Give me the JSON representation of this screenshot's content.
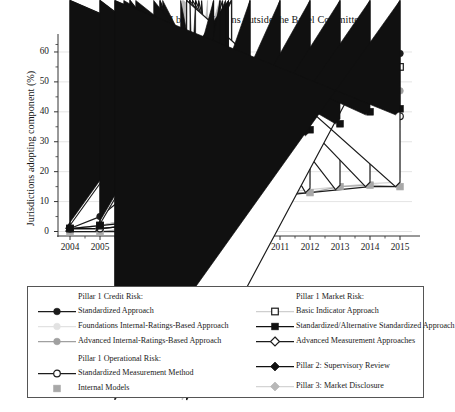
{
  "chart_data": {
    "type": "line",
    "title": "Adoption of Basel II by jurisdictions outside the Basel Committee",
    "xlabel": "Year",
    "ylabel": "Jurisdictions adopting component (%)",
    "x": [
      2004,
      2005,
      2006,
      2007,
      2008,
      2009,
      2010,
      2011,
      2012,
      2013,
      2014,
      2015
    ],
    "xtick_labels": [
      "2004",
      "2005",
      "2006",
      "2007",
      "2008",
      "2009",
      "2010",
      "2011",
      "2012",
      "2013",
      "2014",
      "2015"
    ],
    "ytick_labels": [
      "0",
      "10",
      "20",
      "30",
      "40",
      "50",
      "60"
    ],
    "yticks": [
      0,
      10,
      20,
      30,
      40,
      50,
      60
    ],
    "ylim": [
      -1.5,
      64
    ],
    "xlim": [
      2003.6,
      2015.4
    ],
    "grid": true,
    "grid_axis": "y",
    "legend_position": "below-plot",
    "series": [
      {
        "name": "Standardized Approach",
        "group": "Pillar 1 Credit Risk:",
        "marker": "circle-filled",
        "color": "#1c1c1c",
        "line_color": "#1c1c1c",
        "values": [
          1,
          5,
          13,
          20,
          31,
          37,
          41,
          43,
          48,
          54,
          58,
          59.5
        ]
      },
      {
        "name": "Foundations Internal-Ratings-Based Approach",
        "group": "Pillar 1 Credit Risk:",
        "marker": "circle-filled",
        "color": "#e2e2e2",
        "line_color": "#e2e2e2",
        "values": [
          1,
          2,
          4,
          11,
          23,
          32,
          37,
          39,
          43,
          50,
          54,
          55
        ]
      },
      {
        "name": "Advanced Internal-Ratings-Based Approach",
        "group": "Pillar 1 Credit Risk:",
        "marker": "circle-filled",
        "color": "#a0a0a0",
        "line_color": "#a0a0a0",
        "values": [
          1,
          2,
          4,
          8,
          17,
          23,
          29,
          33,
          34,
          40,
          45,
          47
        ]
      },
      {
        "name": "Standardized Measurement Method",
        "group": "Pillar 1 Operational Risk:",
        "marker": "circle-open",
        "color": "#1c1c1c",
        "line_color": "#1c1c1c",
        "values": [
          1,
          1,
          2,
          6,
          13,
          18,
          30,
          31,
          31,
          34,
          38,
          38.5
        ]
      },
      {
        "name": "Internal Models",
        "group": "Pillar 1 Operational Risk:",
        "marker": "square-filled",
        "color": "#a8a8a8",
        "line_color": "#a8a8a8",
        "values": [
          0,
          0,
          1,
          3,
          6,
          10,
          12,
          13,
          13,
          15,
          15.5,
          15
        ]
      },
      {
        "name": "Basic Indicator Approach",
        "group": "Pillar 1 Market Risk:",
        "marker": "square-open",
        "color": "#1c1c1c",
        "line_color": "#cfcfcf",
        "values": [
          1,
          2,
          4,
          12,
          24,
          33,
          37,
          41,
          45,
          51,
          54,
          55
        ]
      },
      {
        "name": "Standardized/Alternative Standardized Approach",
        "group": "Pillar 1 Market Risk:",
        "marker": "square-filled",
        "color": "#111111",
        "line_color": "#111111",
        "values": [
          1,
          2,
          3,
          8,
          18,
          23,
          30,
          32,
          34,
          36,
          40,
          41
        ]
      },
      {
        "name": "Advanced Measurement Approaches",
        "group": "Pillar 1 Market Risk:",
        "marker": "diamond-open",
        "color": "#1c1c1c",
        "line_color": "#1c1c1c",
        "values": [
          0,
          0,
          0,
          3,
          6,
          10,
          11,
          12,
          13,
          14,
          15,
          15
        ]
      },
      {
        "name": "Pillar 2: Supervisory Review",
        "group": "",
        "marker": "diamond-filled",
        "color": "#101010",
        "line_color": "#101010",
        "values": [
          1,
          1,
          2,
          6,
          12,
          17,
          23,
          26,
          32,
          36,
          39,
          39
        ]
      },
      {
        "name": "Pillar 3: Market Disclosure",
        "group": "",
        "marker": "diamond-filled",
        "color": "#b8b8b8",
        "line_color": "#d4d4d4",
        "values": [
          1,
          1,
          2,
          4,
          8,
          11,
          12,
          13,
          14,
          15,
          16,
          16.5
        ]
      }
    ]
  },
  "legend": {
    "left_column": {
      "headers": [
        "Pillar 1 Credit Risk:",
        "Pillar 1 Operational Risk:"
      ],
      "items": [
        "Standardized Approach",
        "Foundations Internal-Ratings-Based Approach",
        "Advanced Internal-Ratings-Based Approach",
        "Standardized Measurement Method",
        "Internal Models"
      ]
    },
    "right_column": {
      "headers": [
        "Pillar 1 Market Risk:"
      ],
      "items": [
        "Basic Indicator Approach",
        "Standardized/Alternative Standardized Approach",
        "Advanced Measurement Approaches",
        "Pillar 2: Supervisory Review",
        "Pillar 3: Market Disclosure"
      ]
    }
  }
}
